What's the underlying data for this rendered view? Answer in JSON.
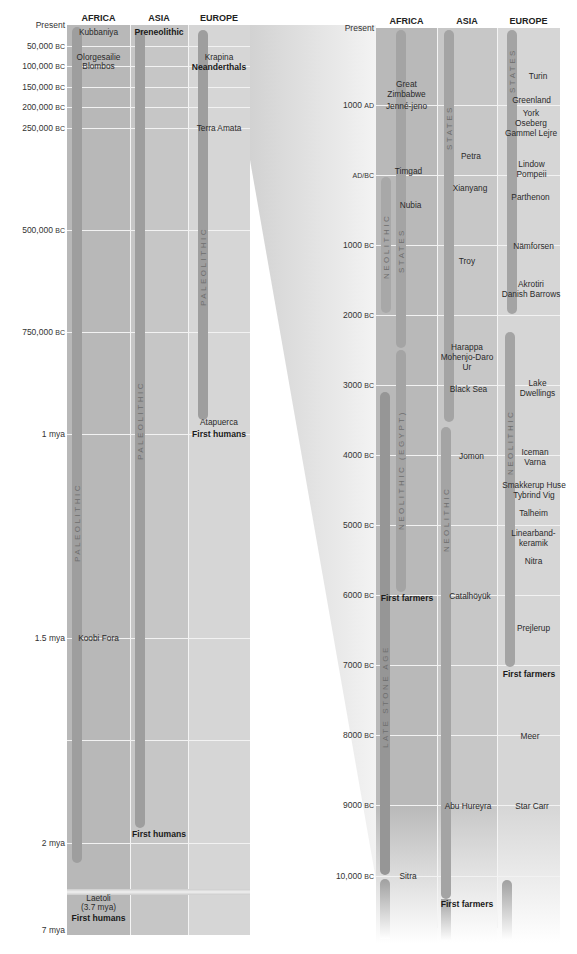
{
  "left_panel": {
    "headers": [
      "AFRICA",
      "ASIA",
      "EUROPE"
    ],
    "ticks": [
      "Present",
      "50,000",
      "100,000",
      "150,000",
      "200,000",
      "250,000",
      "500,000",
      "750,000",
      "1 mya",
      "1.5 mya",
      "2 mya",
      "7 mya"
    ],
    "tick_suffix": "BC",
    "periods": {
      "africa": "PALEOLITHIC",
      "asia": "PALEOLITHIC",
      "europe": "PALEOLITHIC"
    },
    "sites": {
      "kubbaniya": "Kubbaniya",
      "preneolithic": "Preneolithic",
      "olorgesailie": "Olorgesailie",
      "blombos": "Blombos",
      "krapina": "Krapina",
      "neanderthals": "Neanderthals",
      "terra_amata": "Terra Amata",
      "atapuerca": "Atapuerca",
      "first_humans_europe": "First humans",
      "koobi_fora": "Koobi Fora",
      "first_humans_asia": "First humans",
      "laetoli": "Laetoli",
      "laetoli_date": "(3.7 mya)",
      "first_humans_africa": "First humans"
    }
  },
  "right_panel": {
    "headers": [
      "AFRICA",
      "ASIA",
      "EUROPE"
    ],
    "ticks": [
      {
        "num": "Present",
        "era": ""
      },
      {
        "num": "1000",
        "era": "AD"
      },
      {
        "num": "AD/BC",
        "era": ""
      },
      {
        "num": "1000",
        "era": "BC"
      },
      {
        "num": "2000",
        "era": "BC"
      },
      {
        "num": "3000",
        "era": "BC"
      },
      {
        "num": "4000",
        "era": "BC"
      },
      {
        "num": "5000",
        "era": "BC"
      },
      {
        "num": "6000",
        "era": "BC"
      },
      {
        "num": "7000",
        "era": "BC"
      },
      {
        "num": "8000",
        "era": "BC"
      },
      {
        "num": "9000",
        "era": "BC"
      },
      {
        "num": "10,000",
        "era": "BC"
      }
    ],
    "periods": {
      "africa_states": "STATES",
      "africa_neolithic": "NEOLITHIC",
      "africa_neolithic_egypt": "NEOLITHIC (EGYPT)",
      "africa_late_stone_age": "LATE STONE AGE",
      "asia_states": "STATES",
      "asia_neolithic": "NEOLITHIC",
      "europe_states": "STATES",
      "europe_neolithic": "NEOLITHIC"
    },
    "sites": {
      "great_zimbabwe": "Great\nZimbabwe",
      "jenne_jeno": "Jenné-jeno",
      "timgad": "Timgad",
      "nubia": "Nubia",
      "first_farmers_africa": "First farmers",
      "sitra": "Sitra",
      "petra": "Petra",
      "xianyang": "Xianyang",
      "troy": "Troy",
      "harappa": "Harappa\nMohenjo-Daro\nUr",
      "black_sea": "Black Sea",
      "jomon": "Jomon",
      "catalhoyuk": "Catalhöyük",
      "abu_hureyra": "Abu Hureyra",
      "first_farmers_asia": "First farmers",
      "turin": "Turin",
      "greenland": "Greenland",
      "york": "York\nOseberg\nGammel Lejre",
      "lindow": "Lindow\nPompeii",
      "parthenon": "Parthenon",
      "namforsen": "Nämforsen",
      "akrotiri": "Akrotiri\nDanish Barrows",
      "lake_dwellings": "Lake\nDwellings",
      "iceman": "Iceman\nVarna",
      "smakkerup": "Smakkerup Huse\nTybrind Vig",
      "talheim": "Talheim",
      "linearband": "Linearband-\nkeramik",
      "nitra": "Nitra",
      "prejlerup": "Prejlerup",
      "first_farmers_europe": "First farmers",
      "meer": "Meer",
      "star_carr": "Star Carr"
    }
  }
}
